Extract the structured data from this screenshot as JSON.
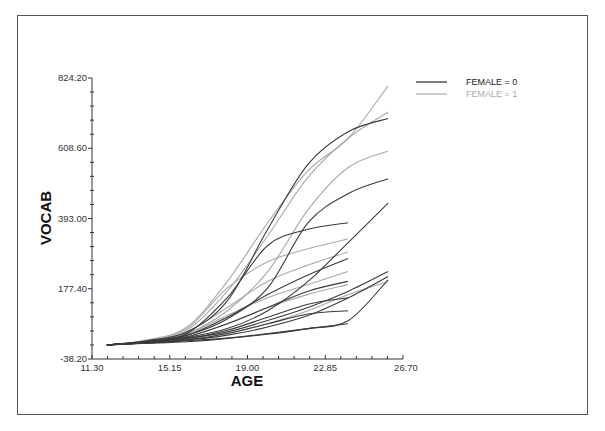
{
  "chart_data": {
    "type": "line",
    "title": "",
    "xlabel": "AGE",
    "ylabel": "VOCAB",
    "xlim": [
      11.3,
      26.7
    ],
    "ylim": [
      -38.2,
      824.2
    ],
    "x_ticks": [
      "11.30",
      "15.15",
      "19.00",
      "22.85",
      "26.70"
    ],
    "y_ticks": [
      "-38.20",
      "177.40",
      "393.00",
      "608.60",
      "824.20"
    ],
    "grid": false,
    "legend_position": "top-right",
    "legend": [
      {
        "label": "FEMALE = 0",
        "color": "#3a3a3a"
      },
      {
        "label": "FEMALE = 1",
        "color": "#a8a8a8"
      }
    ],
    "series": [
      {
        "name": "FEMALE = 0",
        "group": 0,
        "x": [
          12.04,
          14,
          16,
          18,
          20,
          22,
          24,
          25.96
        ],
        "values": [
          5,
          18,
          45,
          140,
          360,
          560,
          660,
          700
        ]
      },
      {
        "name": "FEMALE = 0",
        "group": 0,
        "x": [
          12.04,
          14,
          16,
          18,
          20,
          22,
          24,
          25.96
        ],
        "values": [
          5,
          16,
          35,
          85,
          180,
          380,
          470,
          515
        ]
      },
      {
        "name": "FEMALE = 0",
        "group": 0,
        "x": [
          12.04,
          14,
          16,
          18,
          20,
          22,
          24,
          25.96
        ],
        "values": [
          5,
          14,
          28,
          55,
          110,
          200,
          320,
          440
        ]
      },
      {
        "name": "FEMALE = 0",
        "group": 0,
        "x": [
          12.04,
          14,
          16,
          18,
          20,
          22,
          24,
          25.96
        ],
        "values": [
          5,
          13,
          25,
          45,
          80,
          120,
          170,
          230
        ]
      },
      {
        "name": "FEMALE = 0",
        "group": 0,
        "x": [
          12.04,
          14,
          16,
          18,
          20,
          22,
          24,
          25.96
        ],
        "values": [
          5,
          12,
          20,
          35,
          60,
          95,
          150,
          215
        ]
      },
      {
        "name": "FEMALE = 0",
        "group": 0,
        "x": [
          12.04,
          14,
          16,
          18,
          20,
          22,
          24,
          25.96
        ],
        "values": [
          5,
          11,
          18,
          26,
          38,
          55,
          80,
          205
        ]
      },
      {
        "name": "FEMALE = 0",
        "group": 0,
        "x": [
          12.04,
          14,
          16,
          18,
          20,
          22,
          23.97
        ],
        "values": [
          5,
          15,
          40,
          150,
          310,
          360,
          380
        ]
      },
      {
        "name": "FEMALE = 0",
        "group": 0,
        "x": [
          12.04,
          14,
          16,
          18,
          20,
          22,
          23.97
        ],
        "values": [
          5,
          14,
          34,
          90,
          160,
          220,
          270
        ]
      },
      {
        "name": "FEMALE = 0",
        "group": 0,
        "x": [
          12.04,
          14,
          16,
          18,
          20,
          22,
          23.97
        ],
        "values": [
          5,
          13,
          30,
          70,
          120,
          170,
          200
        ]
      },
      {
        "name": "FEMALE = 0",
        "group": 0,
        "x": [
          12.04,
          14,
          16,
          18,
          20,
          22,
          23.97
        ],
        "values": [
          5,
          12,
          24,
          50,
          90,
          130,
          150
        ]
      },
      {
        "name": "FEMALE = 0",
        "group": 0,
        "x": [
          12.04,
          14,
          16,
          18,
          20,
          22,
          23.97
        ],
        "values": [
          5,
          11,
          20,
          40,
          70,
          100,
          110
        ]
      },
      {
        "name": "FEMALE = 0",
        "group": 0,
        "x": [
          12.04,
          14,
          16,
          18,
          20,
          22,
          23.97
        ],
        "values": [
          5,
          10,
          15,
          25,
          40,
          55,
          70
        ]
      },
      {
        "name": "FEMALE = 1",
        "group": 1,
        "x": [
          12.04,
          14,
          16,
          18,
          20,
          22,
          24,
          25.96
        ],
        "values": [
          5,
          20,
          60,
          200,
          380,
          540,
          640,
          800
        ]
      },
      {
        "name": "FEMALE = 1",
        "group": 1,
        "x": [
          12.04,
          14,
          16,
          18,
          20,
          22,
          24,
          25.96
        ],
        "values": [
          5,
          18,
          50,
          170,
          340,
          520,
          640,
          720
        ]
      },
      {
        "name": "FEMALE = 1",
        "group": 1,
        "x": [
          12.04,
          14,
          16,
          18,
          20,
          22,
          24,
          25.96
        ],
        "values": [
          5,
          16,
          40,
          110,
          230,
          420,
          550,
          600
        ]
      },
      {
        "name": "FEMALE = 1",
        "group": 1,
        "x": [
          12.04,
          14,
          16,
          18,
          20,
          22,
          24,
          25.96
        ],
        "values": [
          5,
          12,
          22,
          40,
          70,
          110,
          160,
          200
        ]
      },
      {
        "name": "FEMALE = 1",
        "group": 1,
        "x": [
          12.04,
          14,
          16,
          18,
          20,
          22,
          23.97
        ],
        "values": [
          5,
          17,
          55,
          180,
          260,
          300,
          330
        ]
      },
      {
        "name": "FEMALE = 1",
        "group": 1,
        "x": [
          12.04,
          14,
          16,
          18,
          20,
          22,
          23.97
        ],
        "values": [
          5,
          15,
          45,
          120,
          200,
          250,
          290
        ]
      },
      {
        "name": "FEMALE = 1",
        "group": 1,
        "x": [
          12.04,
          14,
          16,
          18,
          20,
          22,
          23.97
        ],
        "values": [
          5,
          14,
          38,
          95,
          150,
          190,
          230
        ]
      },
      {
        "name": "FEMALE = 1",
        "group": 1,
        "x": [
          12.04,
          14,
          16,
          18,
          20,
          22,
          23.97
        ],
        "values": [
          5,
          13,
          30,
          70,
          120,
          160,
          190
        ]
      }
    ]
  },
  "axes": {
    "x_title": "AGE",
    "y_title": "VOCAB"
  },
  "legend": {
    "item0": "FEMALE = 0",
    "item1": "FEMALE = 1"
  },
  "colors": {
    "female0": "#3a3a3a",
    "female1": "#a8a8a8",
    "axis": "#333333"
  }
}
